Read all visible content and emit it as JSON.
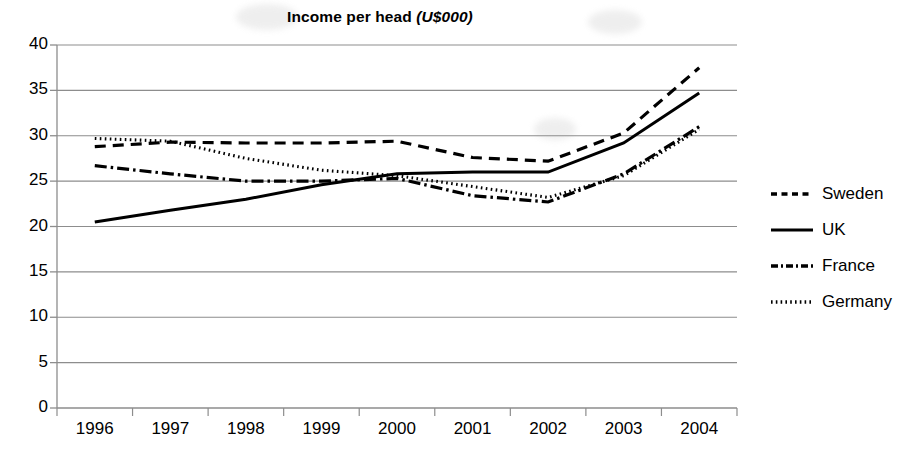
{
  "chart_data": {
    "type": "line",
    "title": "Income per head (U$000)",
    "title_main": "Income per head ",
    "title_unit": "(U$000)",
    "xlabel": "",
    "ylabel": "",
    "categories": [
      "1996",
      "1997",
      "1998",
      "1999",
      "2000",
      "2001",
      "2002",
      "2003",
      "2004"
    ],
    "ylim": [
      0,
      40
    ],
    "ytick_step": 5,
    "yticks": [
      "40",
      "35",
      "30",
      "25",
      "20",
      "15",
      "10",
      "5",
      "0"
    ],
    "grid": true,
    "legend_position": "right",
    "series": [
      {
        "name": "Sweden",
        "style": "dashed",
        "color": "#000000",
        "values": [
          28.8,
          29.3,
          29.2,
          29.2,
          29.4,
          27.6,
          27.2,
          30.3,
          37.5
        ]
      },
      {
        "name": "UK",
        "style": "solid",
        "color": "#000000",
        "values": [
          20.5,
          21.8,
          23.0,
          24.6,
          25.8,
          26.0,
          26.0,
          29.2,
          34.7
        ]
      },
      {
        "name": "France",
        "style": "dash-dot",
        "color": "#000000",
        "values": [
          26.7,
          25.8,
          25.0,
          25.0,
          25.3,
          23.4,
          22.7,
          25.8,
          31.0
        ]
      },
      {
        "name": "Germany",
        "style": "dotted",
        "color": "#000000",
        "values": [
          29.7,
          29.4,
          27.5,
          26.2,
          25.6,
          24.4,
          23.2,
          25.6,
          30.7
        ]
      }
    ]
  },
  "legend": {
    "items": [
      {
        "label": "Sweden",
        "style": "dashed"
      },
      {
        "label": "UK",
        "style": "solid"
      },
      {
        "label": "France",
        "style": "dash-dot"
      },
      {
        "label": "Germany",
        "style": "dotted"
      }
    ]
  },
  "axis": {
    "y_labels": [
      "40",
      "35",
      "30",
      "25",
      "20",
      "15",
      "10",
      "5",
      "0"
    ],
    "x_labels": [
      "1996",
      "1997",
      "1998",
      "1999",
      "2000",
      "2001",
      "2002",
      "2003",
      "2004"
    ]
  }
}
